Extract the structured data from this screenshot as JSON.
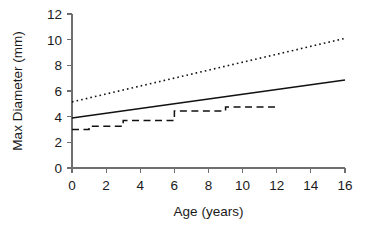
{
  "chart_data": {
    "type": "line",
    "title": "",
    "xlabel": "Age (years)",
    "ylabel": "Max Diameter (mm)",
    "xlim": [
      0,
      16
    ],
    "ylim": [
      0,
      12
    ],
    "xticks": [
      0,
      2,
      4,
      6,
      8,
      10,
      12,
      14,
      16
    ],
    "yticks": [
      0,
      2,
      4,
      6,
      8,
      10,
      12
    ],
    "xtick_labels": [
      "0",
      "2",
      "4",
      "6",
      "8",
      "10",
      "12",
      "14",
      "16"
    ],
    "ytick_labels": [
      "0",
      "2",
      "4",
      "6",
      "8",
      "10",
      "12"
    ],
    "grid": false,
    "legend": "none",
    "series": [
      {
        "name": "upper-regression-dotted",
        "style": "dotted",
        "color": "#111111",
        "x": [
          0,
          16
        ],
        "values": [
          5.15,
          10.1
        ]
      },
      {
        "name": "mean-regression-solid",
        "style": "solid",
        "color": "#111111",
        "x": [
          0,
          16
        ],
        "values": [
          3.9,
          6.85
        ]
      },
      {
        "name": "observed-step-dashed",
        "style": "dashed-step",
        "color": "#111111",
        "x": [
          0,
          1,
          1,
          3,
          3,
          6,
          6,
          9,
          9,
          12
        ],
        "values": [
          3.0,
          3.0,
          3.25,
          3.25,
          3.7,
          3.7,
          4.45,
          4.45,
          4.75,
          4.75
        ]
      }
    ]
  }
}
